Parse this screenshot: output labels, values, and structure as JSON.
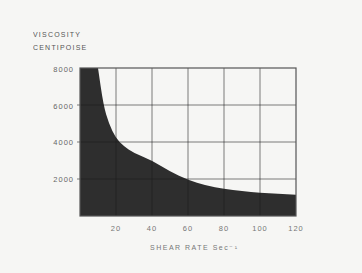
{
  "chart_data": {
    "type": "area",
    "title": "",
    "ylabel": [
      "VISCOSITY",
      "CENTIPOISE"
    ],
    "xlabel": "SHEAR RATE  Sec⁻¹",
    "xlim": [
      0,
      120
    ],
    "ylim": [
      0,
      8000
    ],
    "xticks": [
      "20",
      "40",
      "60",
      "80",
      "100",
      "120"
    ],
    "yticks": [
      "8000",
      "6000",
      "4000",
      "2000"
    ],
    "grid": true,
    "legend": null,
    "series": [
      {
        "name": "Viscosity",
        "x": [
          10,
          13,
          16,
          20,
          24,
          30,
          40,
          50,
          60,
          70,
          80,
          90,
          100,
          110,
          120
        ],
        "values": [
          8000,
          6000,
          5000,
          4200,
          3800,
          3400,
          3000,
          2400,
          1950,
          1650,
          1450,
          1350,
          1250,
          1200,
          1150
        ],
        "fill_color": "#2e2e2e"
      }
    ]
  },
  "colors": {
    "background": "#f6f6f4",
    "fill": "#2e2e2e",
    "grid_on_fill": "#1c1c1c",
    "axis": "#555555"
  }
}
